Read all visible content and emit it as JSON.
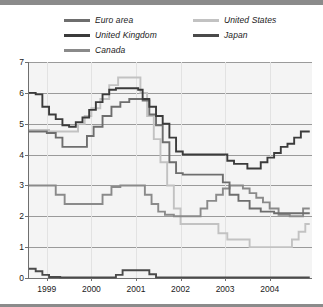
{
  "figure": {
    "background": "#ffffff",
    "plot_background": "#f4f4f4",
    "axis_color": "#6f6f6f",
    "grid_color": "#9a9a9a"
  },
  "legend": {
    "columns": [
      {
        "items": [
          {
            "label": "Euro area",
            "color": "#6e6e6e"
          },
          {
            "label": "United Kingdom",
            "color": "#3b3b3b"
          },
          {
            "label": "Canada",
            "color": "#8a8a8a"
          }
        ]
      },
      {
        "items": [
          {
            "label": "United States",
            "color": "#c2c2c2"
          },
          {
            "label": "Japan",
            "color": "#4a4a4a"
          }
        ]
      }
    ]
  },
  "axes": {
    "y_ticks": [
      "0",
      "1",
      "2",
      "3",
      "4",
      "5",
      "6",
      "7"
    ],
    "x_ticks": [
      "1999",
      "2000",
      "2001",
      "2002",
      "2003",
      "2004"
    ]
  },
  "chart_data": {
    "type": "line",
    "title": "",
    "subtitle": "",
    "xlabel": "",
    "ylabel": "",
    "xlim": [
      1998.6,
      2004.95
    ],
    "ylim": [
      0,
      7
    ],
    "grid": true,
    "legend_position": "top",
    "x_tick_values": [
      1999,
      2000,
      2001,
      2002,
      2003,
      2004
    ],
    "y_tick_values": [
      0,
      1,
      2,
      3,
      4,
      5,
      6,
      7
    ],
    "series": [
      {
        "name": "Euro area",
        "color": "#6e6e6e",
        "points": [
          [
            1998.6,
            4.75
          ],
          [
            1998.8,
            4.75
          ],
          [
            1999.0,
            4.7
          ],
          [
            1999.2,
            4.55
          ],
          [
            1999.35,
            4.25
          ],
          [
            1999.5,
            4.25
          ],
          [
            1999.7,
            4.25
          ],
          [
            1999.9,
            4.6
          ],
          [
            2000.05,
            4.9
          ],
          [
            2000.25,
            5.25
          ],
          [
            2000.45,
            5.55
          ],
          [
            2000.65,
            5.7
          ],
          [
            2000.85,
            5.8
          ],
          [
            2001.0,
            5.8
          ],
          [
            2001.15,
            5.75
          ],
          [
            2001.3,
            5.3
          ],
          [
            2001.45,
            4.95
          ],
          [
            2001.6,
            4.4
          ],
          [
            2001.75,
            3.75
          ],
          [
            2001.9,
            3.4
          ],
          [
            2002.05,
            3.35
          ],
          [
            2002.3,
            3.35
          ],
          [
            2002.55,
            3.35
          ],
          [
            2002.8,
            3.35
          ],
          [
            2002.95,
            3.1
          ],
          [
            2003.1,
            2.7
          ],
          [
            2003.3,
            2.5
          ],
          [
            2003.55,
            2.25
          ],
          [
            2003.8,
            2.15
          ],
          [
            2004.1,
            2.1
          ],
          [
            2004.4,
            2.1
          ],
          [
            2004.7,
            2.1
          ],
          [
            2004.9,
            2.1
          ]
        ]
      },
      {
        "name": "United Kingdom",
        "color": "#3b3b3b",
        "points": [
          [
            1998.6,
            6.0
          ],
          [
            1998.75,
            5.95
          ],
          [
            1998.9,
            5.55
          ],
          [
            1999.05,
            5.3
          ],
          [
            1999.2,
            5.15
          ],
          [
            1999.35,
            4.95
          ],
          [
            1999.5,
            4.9
          ],
          [
            1999.65,
            5.05
          ],
          [
            1999.8,
            5.2
          ],
          [
            1999.95,
            5.45
          ],
          [
            2000.1,
            5.7
          ],
          [
            2000.25,
            5.95
          ],
          [
            2000.4,
            6.1
          ],
          [
            2000.55,
            6.15
          ],
          [
            2000.75,
            6.15
          ],
          [
            2000.95,
            6.15
          ],
          [
            2001.05,
            6.1
          ],
          [
            2001.15,
            5.8
          ],
          [
            2001.3,
            5.55
          ],
          [
            2001.45,
            5.25
          ],
          [
            2001.6,
            5.0
          ],
          [
            2001.75,
            4.55
          ],
          [
            2001.9,
            4.1
          ],
          [
            2002.05,
            4.0
          ],
          [
            2002.3,
            4.0
          ],
          [
            2002.6,
            4.0
          ],
          [
            2002.9,
            4.0
          ],
          [
            2003.05,
            3.8
          ],
          [
            2003.2,
            3.7
          ],
          [
            2003.35,
            3.7
          ],
          [
            2003.5,
            3.55
          ],
          [
            2003.65,
            3.55
          ],
          [
            2003.8,
            3.75
          ],
          [
            2003.95,
            3.9
          ],
          [
            2004.1,
            4.05
          ],
          [
            2004.25,
            4.25
          ],
          [
            2004.4,
            4.35
          ],
          [
            2004.55,
            4.55
          ],
          [
            2004.7,
            4.75
          ],
          [
            2004.9,
            4.75
          ]
        ]
      },
      {
        "name": "Canada",
        "color": "#8a8a8a",
        "points": [
          [
            1998.6,
            3.0
          ],
          [
            1998.85,
            3.0
          ],
          [
            1999.05,
            3.0
          ],
          [
            1999.2,
            2.7
          ],
          [
            1999.4,
            2.4
          ],
          [
            1999.65,
            2.4
          ],
          [
            1999.9,
            2.4
          ],
          [
            2000.1,
            2.4
          ],
          [
            2000.25,
            2.7
          ],
          [
            2000.45,
            2.95
          ],
          [
            2000.65,
            3.0
          ],
          [
            2000.85,
            3.0
          ],
          [
            2001.05,
            3.0
          ],
          [
            2001.2,
            2.7
          ],
          [
            2001.35,
            2.4
          ],
          [
            2001.5,
            2.15
          ],
          [
            2001.65,
            2.05
          ],
          [
            2001.85,
            2.0
          ],
          [
            2002.05,
            2.0
          ],
          [
            2002.25,
            2.0
          ],
          [
            2002.45,
            2.25
          ],
          [
            2002.6,
            2.5
          ],
          [
            2002.8,
            2.7
          ],
          [
            2002.95,
            2.9
          ],
          [
            2003.1,
            3.0
          ],
          [
            2003.25,
            3.0
          ],
          [
            2003.4,
            2.9
          ],
          [
            2003.55,
            2.75
          ],
          [
            2003.7,
            2.6
          ],
          [
            2003.85,
            2.45
          ],
          [
            2004.0,
            2.25
          ],
          [
            2004.2,
            2.05
          ],
          [
            2004.45,
            2.0
          ],
          [
            2004.6,
            2.0
          ],
          [
            2004.75,
            2.25
          ],
          [
            2004.9,
            2.25
          ]
        ]
      },
      {
        "name": "United States",
        "color": "#c2c2c2",
        "points": [
          [
            1998.6,
            4.8
          ],
          [
            1998.85,
            4.8
          ],
          [
            1999.05,
            4.75
          ],
          [
            1999.25,
            4.75
          ],
          [
            1999.4,
            4.75
          ],
          [
            1999.55,
            4.75
          ],
          [
            1999.7,
            5.0
          ],
          [
            1999.85,
            5.25
          ],
          [
            2000.0,
            5.5
          ],
          [
            2000.2,
            5.8
          ],
          [
            2000.4,
            6.25
          ],
          [
            2000.6,
            6.5
          ],
          [
            2000.8,
            6.5
          ],
          [
            2001.0,
            6.5
          ],
          [
            2001.1,
            6.0
          ],
          [
            2001.25,
            5.25
          ],
          [
            2001.4,
            4.5
          ],
          [
            2001.55,
            3.75
          ],
          [
            2001.7,
            3.0
          ],
          [
            2001.85,
            2.25
          ],
          [
            2002.0,
            1.75
          ],
          [
            2002.2,
            1.75
          ],
          [
            2002.45,
            1.75
          ],
          [
            2002.7,
            1.75
          ],
          [
            2002.85,
            1.45
          ],
          [
            2003.05,
            1.25
          ],
          [
            2003.3,
            1.25
          ],
          [
            2003.55,
            1.0
          ],
          [
            2003.8,
            1.0
          ],
          [
            2004.05,
            1.0
          ],
          [
            2004.3,
            1.0
          ],
          [
            2004.5,
            1.25
          ],
          [
            2004.65,
            1.5
          ],
          [
            2004.8,
            1.75
          ],
          [
            2004.9,
            1.75
          ]
        ]
      },
      {
        "name": "Japan",
        "color": "#4a4a4a",
        "points": [
          [
            1998.6,
            0.3
          ],
          [
            1998.75,
            0.22
          ],
          [
            1998.9,
            0.1
          ],
          [
            1999.05,
            0.03
          ],
          [
            1999.3,
            0.02
          ],
          [
            1999.7,
            0.02
          ],
          [
            2000.1,
            0.02
          ],
          [
            2000.4,
            0.02
          ],
          [
            2000.55,
            0.1
          ],
          [
            2000.7,
            0.25
          ],
          [
            2000.9,
            0.25
          ],
          [
            2001.05,
            0.25
          ],
          [
            2001.2,
            0.25
          ],
          [
            2001.3,
            0.12
          ],
          [
            2001.45,
            0.02
          ],
          [
            2001.8,
            0.02
          ],
          [
            2002.2,
            0.02
          ],
          [
            2002.7,
            0.02
          ],
          [
            2003.2,
            0.02
          ],
          [
            2003.7,
            0.02
          ],
          [
            2004.2,
            0.02
          ],
          [
            2004.6,
            0.02
          ],
          [
            2004.9,
            0.02
          ]
        ]
      }
    ]
  }
}
